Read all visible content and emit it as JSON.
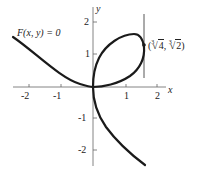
{
  "diagram": {
    "type": "implicit-curve-plot",
    "equation_label": "F(x, y) = 0",
    "curve": "folium-like cubic with loop in quadrant I and tails in quadrants II and IV",
    "axes": {
      "x_label": "x",
      "y_label": "y",
      "x_ticks": [
        "-2",
        "-1",
        "1",
        "2"
      ],
      "y_ticks": [
        "2",
        "1",
        "-1",
        "-2"
      ]
    },
    "marked_point": {
      "label_prefix": "(",
      "x_index": "3",
      "x_radicand": "4",
      "separator": ", ",
      "y_index": "3",
      "y_radicand": "2",
      "label_suffix": ")",
      "description": "point of vertical tangency"
    },
    "tangent_line": "vertical line x = cube-root(4)",
    "colors": {
      "curve": "#1a1a1a",
      "axes": "#555555",
      "text": "#222222"
    }
  }
}
